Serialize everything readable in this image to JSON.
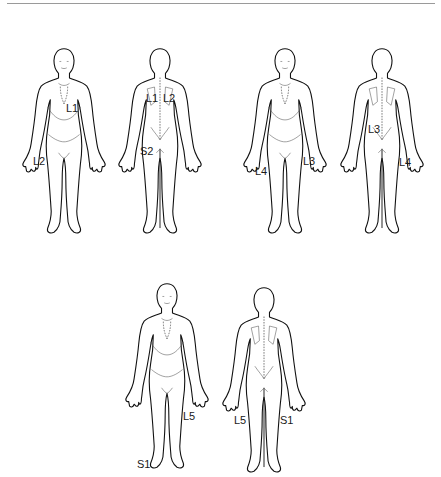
{
  "diagram": {
    "type": "dermatome-map",
    "figures": [
      {
        "id": "fig1-front",
        "view": "front",
        "labels": [
          {
            "text": "L1",
            "x": 62,
            "y": 103
          },
          {
            "text": "L2",
            "x": 32,
            "y": 157
          }
        ]
      },
      {
        "id": "fig1-back",
        "view": "back",
        "labels": [
          {
            "text": "L1",
            "x": 146,
            "y": 93
          },
          {
            "text": "L2",
            "x": 163,
            "y": 93
          },
          {
            "text": "S2",
            "x": 140,
            "y": 148
          }
        ]
      },
      {
        "id": "fig2-front",
        "view": "front",
        "labels": [
          {
            "text": "L3",
            "x": 303,
            "y": 157
          },
          {
            "text": "L4",
            "x": 255,
            "y": 167
          }
        ]
      },
      {
        "id": "fig2-back",
        "view": "back",
        "labels": [
          {
            "text": "L3",
            "x": 368,
            "y": 125
          },
          {
            "text": "L4",
            "x": 399,
            "y": 157
          }
        ]
      },
      {
        "id": "fig3-front",
        "view": "front",
        "labels": [
          {
            "text": "L5",
            "x": 183,
            "y": 411
          },
          {
            "text": "S1",
            "x": 138,
            "y": 460
          }
        ]
      },
      {
        "id": "fig3-back",
        "view": "back",
        "labels": [
          {
            "text": "L5",
            "x": 234,
            "y": 415
          },
          {
            "text": "S1",
            "x": 280,
            "y": 415
          }
        ]
      }
    ]
  },
  "labels": {
    "f1_L1": "L1",
    "f1_L2": "L2",
    "b1_L1": "L1",
    "b1_L2": "L2",
    "b1_S2": "S2",
    "f2_L3": "L3",
    "f2_L4": "L4",
    "b2_L3": "L3",
    "b2_L4": "L4",
    "f3_L5": "L5",
    "f3_S1": "S1",
    "b3_L5": "L5",
    "b3_S1": "S1"
  }
}
